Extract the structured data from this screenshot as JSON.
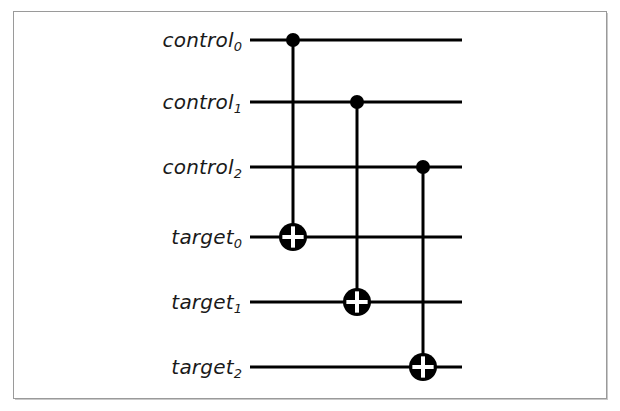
{
  "figure": {
    "kind": "quantum-circuit-diagram",
    "background_color": "#ffffff",
    "ink_color": "#000000",
    "frame_color": "#9a9a9a",
    "width": 620,
    "height": 411
  },
  "wires": [
    {
      "id": "control0",
      "name": "control",
      "index": "0",
      "label_text": "control",
      "subscript": "0",
      "y": 40,
      "role": "control"
    },
    {
      "id": "control1",
      "name": "control",
      "index": "1",
      "label_text": "control",
      "subscript": "1",
      "y": 102,
      "role": "control"
    },
    {
      "id": "control2",
      "name": "control",
      "index": "2",
      "label_text": "control",
      "subscript": "2",
      "y": 167,
      "role": "control"
    },
    {
      "id": "target0",
      "name": "target",
      "index": "0",
      "label_text": "target",
      "subscript": "0",
      "y": 237,
      "role": "target"
    },
    {
      "id": "target1",
      "name": "target",
      "index": "1",
      "label_text": "target",
      "subscript": "1",
      "y": 302,
      "role": "target"
    },
    {
      "id": "target2",
      "name": "target",
      "index": "2",
      "label_text": "target",
      "subscript": "2",
      "y": 367,
      "role": "target"
    }
  ],
  "wire_geometry": {
    "x_start": 250,
    "x_end": 462,
    "label_right_edge": 242,
    "stroke_width": 3
  },
  "gates": [
    {
      "id": "cnot-0",
      "type": "CNOT",
      "x": 293,
      "control_wire": "control0",
      "control_y": 40,
      "target_wire": "target0",
      "target_y": 237,
      "control_dot_radius": 7,
      "target_radius": 14,
      "target_glyph": "plus"
    },
    {
      "id": "cnot-1",
      "type": "CNOT",
      "x": 357,
      "control_wire": "control1",
      "control_y": 102,
      "target_wire": "target1",
      "target_y": 302,
      "control_dot_radius": 7,
      "target_radius": 14,
      "target_glyph": "plus"
    },
    {
      "id": "cnot-2",
      "type": "CNOT",
      "x": 423,
      "control_wire": "control2",
      "control_y": 167,
      "target_wire": "target2",
      "target_y": 367,
      "control_dot_radius": 7,
      "target_radius": 14,
      "target_glyph": "plus"
    }
  ]
}
